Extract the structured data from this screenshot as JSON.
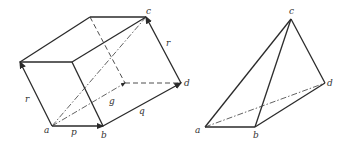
{
  "figures": [
    {
      "name": "parallelepiped",
      "vertex_labels": {
        "a": "a",
        "b": "b",
        "c": "c",
        "d": "d"
      },
      "vector_labels": {
        "p": "p",
        "q": "q",
        "r_left": "r",
        "r_right": "r",
        "g": "g"
      }
    },
    {
      "name": "tetrahedron",
      "vertex_labels": {
        "a": "a",
        "b": "b",
        "c": "c",
        "d": "d"
      }
    }
  ],
  "colors": {
    "line": "#2a2a2a",
    "background": "#ffffff"
  }
}
